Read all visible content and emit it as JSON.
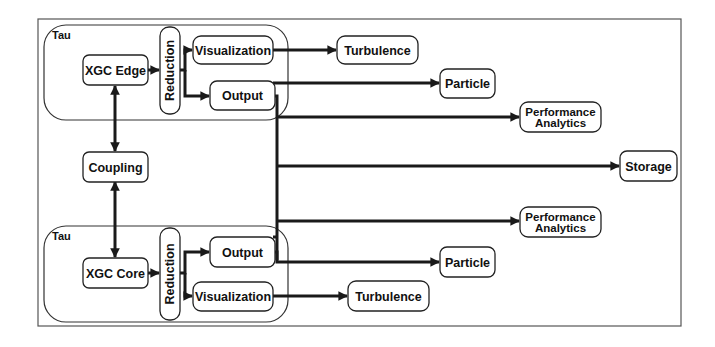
{
  "diagram": {
    "colors": {
      "stroke": "#1a1a1a",
      "node_fill": "#ffffff",
      "frame": "#555555"
    },
    "groups": {
      "tau_top": {
        "label": "Tau"
      },
      "tau_bottom": {
        "label": "Tau"
      }
    },
    "nodes": {
      "xgc_edge": {
        "label": "XGC Edge"
      },
      "reduction_top": {
        "label": "Reduction"
      },
      "visualization_top": {
        "label": "Visualization"
      },
      "output_top": {
        "label": "Output"
      },
      "turbulence_top": {
        "label": "Turbulence"
      },
      "particle_top": {
        "label": "Particle"
      },
      "performance_analytics_top": {
        "line1": "Performance",
        "line2": "Analytics"
      },
      "storage": {
        "label": "Storage"
      },
      "coupling": {
        "label": "Coupling"
      },
      "xgc_core": {
        "label": "XGC Core"
      },
      "reduction_bottom": {
        "label": "Reduction"
      },
      "output_bottom": {
        "label": "Output"
      },
      "visualization_bottom": {
        "label": "Visualization"
      },
      "turbulence_bottom": {
        "label": "Turbulence"
      },
      "particle_bottom": {
        "label": "Particle"
      },
      "performance_analytics_bottom": {
        "line1": "Performance",
        "line2": "Analytics"
      }
    },
    "edges": [
      {
        "from": "XGC Edge",
        "to": "Reduction"
      },
      {
        "from": "Reduction",
        "to": "Visualization"
      },
      {
        "from": "Reduction",
        "to": "Output"
      },
      {
        "from": "Visualization",
        "to": "Turbulence"
      },
      {
        "from": "Output",
        "to": "Particle"
      },
      {
        "from": "Output",
        "to": "Performance Analytics"
      },
      {
        "from": "Output",
        "to": "Storage"
      },
      {
        "from": "XGC Edge",
        "to": "Coupling",
        "bidirectional": true
      },
      {
        "from": "Coupling",
        "to": "XGC Core",
        "bidirectional": true
      },
      {
        "from": "XGC Core",
        "to": "Reduction"
      },
      {
        "from": "Reduction",
        "to": "Output"
      },
      {
        "from": "Reduction",
        "to": "Visualization"
      },
      {
        "from": "Visualization",
        "to": "Turbulence"
      },
      {
        "from": "Output",
        "to": "Particle"
      },
      {
        "from": "Output",
        "to": "Performance Analytics"
      },
      {
        "from": "Output",
        "to": "Storage"
      }
    ]
  }
}
